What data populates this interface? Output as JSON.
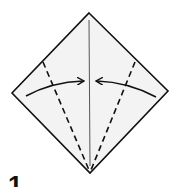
{
  "diagram": {
    "type": "origami-fold-step",
    "step_number": "1",
    "paper": {
      "shape": "square-diamond",
      "fill": "#f3f3f3",
      "stroke": "#111111",
      "vertices": {
        "top": [
          89,
          13
        ],
        "right": [
          168,
          91
        ],
        "bottom": [
          90,
          173
        ],
        "left": [
          12,
          93
        ]
      }
    },
    "creases": [
      {
        "name": "center-crease",
        "style": "solid-thin",
        "from": [
          89,
          20
        ],
        "to": [
          90,
          166
        ]
      },
      {
        "name": "left-valley-fold",
        "style": "dashed",
        "from": [
          43,
          62
        ],
        "to": [
          89,
          170
        ]
      },
      {
        "name": "right-valley-fold",
        "style": "dashed",
        "from": [
          135,
          62
        ],
        "to": [
          91,
          170
        ]
      }
    ],
    "arrows": [
      {
        "name": "left-fold-arrow",
        "direction": "right",
        "from": [
          26,
          96
        ],
        "to": [
          83,
          81
        ]
      },
      {
        "name": "right-fold-arrow",
        "direction": "left",
        "from": [
          156,
          97
        ],
        "to": [
          97,
          81
        ]
      }
    ],
    "instruction": "Fold both lower edges to the center crease (kite base)"
  }
}
